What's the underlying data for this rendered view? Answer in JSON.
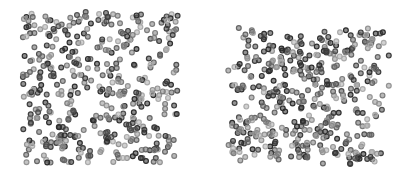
{
  "image": {
    "description": "Two square clusters of overlapping gray ring-shaped particles on white background",
    "background_color": "#ffffff",
    "panels": [
      {
        "name": "left-particle-cluster",
        "particle_count": 430,
        "seed": 17,
        "shades": [
          "#2e2e2e",
          "#3d3d3d",
          "#4f4f4f",
          "#666666",
          "#7d7d7d",
          "#949494",
          "#ababab"
        ]
      },
      {
        "name": "right-particle-cluster",
        "particle_count": 430,
        "seed": 91,
        "shades": [
          "#2e2e2e",
          "#3d3d3d",
          "#4f4f4f",
          "#666666",
          "#7d7d7d",
          "#949494",
          "#ababab"
        ]
      }
    ]
  }
}
